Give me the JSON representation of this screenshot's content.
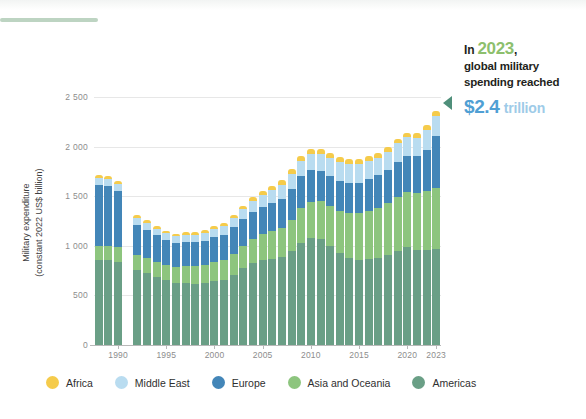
{
  "decor": {
    "accent_rule_color": "#bdd4c2",
    "top_strip_color": "#f2f4f3"
  },
  "annotation": {
    "prefix": "In",
    "year": "2023",
    "comma": ",",
    "line2": "global military",
    "line3": "spending reached",
    "amount": "$2.4",
    "unit": "trillion",
    "year_color": "#8dbf6d",
    "amount_color": "#4f9fd4",
    "unit_color": "#9ecbe8",
    "arrow_icon": "triangle-left-icon",
    "arrow_color": "#4f8f7a"
  },
  "chart_data": {
    "type": "bar",
    "stacked": true,
    "title": "",
    "subtitle": "",
    "xlabel": "",
    "ylabel": "Military expenditure (constant 2022 US$ billion)",
    "ylabel_line1": "Military expenditure",
    "ylabel_line2": "(constant 2022 US$ billion)",
    "ylim": [
      0,
      2500
    ],
    "yticks": [
      0,
      500,
      1000,
      1500,
      2000,
      2500
    ],
    "ytick_labels": [
      "0",
      "500",
      "1 000",
      "1 500",
      "2 000",
      "2 500"
    ],
    "xticks": [
      1990,
      1995,
      2000,
      2005,
      2010,
      2015,
      2020,
      2023
    ],
    "xtick_labels": [
      "1990",
      "1995",
      "2000",
      "2005",
      "2010",
      "2015",
      "2020",
      "2023"
    ],
    "grid": true,
    "legend_position": "bottom",
    "categories": [
      1988,
      1989,
      1990,
      1991,
      1992,
      1993,
      1994,
      1995,
      1996,
      1997,
      1998,
      1999,
      2000,
      2001,
      2002,
      2003,
      2004,
      2005,
      2006,
      2007,
      2008,
      2009,
      2010,
      2011,
      2012,
      2013,
      2014,
      2015,
      2016,
      2017,
      2018,
      2019,
      2020,
      2021,
      2022,
      2023
    ],
    "missing_years": [
      1991
    ],
    "series": [
      {
        "name": "Americas",
        "color": "#6a9f86",
        "values": [
          860,
          855,
          840,
          null,
          760,
          725,
          690,
          655,
          625,
          625,
          620,
          625,
          645,
          655,
          705,
          775,
          830,
          860,
          870,
          885,
          945,
          1030,
          1075,
          1065,
          1000,
          930,
          880,
          860,
          865,
          880,
          905,
          950,
          985,
          955,
          960,
          970
        ]
      },
      {
        "name": "Asia and Oceania",
        "color": "#8dc57e",
        "values": [
          135,
          140,
          145,
          null,
          150,
          150,
          150,
          155,
          160,
          170,
          175,
          180,
          190,
          200,
          215,
          225,
          240,
          255,
          275,
          295,
          320,
          350,
          370,
          385,
          405,
          425,
          450,
          470,
          490,
          505,
          525,
          545,
          560,
          575,
          590,
          615
        ]
      },
      {
        "name": "Europe",
        "color": "#4386b8",
        "values": [
          620,
          610,
          565,
          null,
          300,
          285,
          265,
          250,
          245,
          245,
          240,
          245,
          250,
          255,
          265,
          270,
          275,
          280,
          285,
          295,
          310,
          320,
          315,
          305,
          300,
          300,
          300,
          305,
          315,
          325,
          335,
          350,
          365,
          375,
          420,
          520
        ]
      },
      {
        "name": "Middle East",
        "color": "#b9dcf0",
        "values": [
          65,
          68,
          70,
          null,
          72,
          70,
          68,
          68,
          68,
          72,
          75,
          78,
          85,
          90,
          95,
          100,
          110,
          120,
          130,
          140,
          150,
          160,
          165,
          170,
          180,
          190,
          200,
          195,
          185,
          180,
          185,
          190,
          185,
          185,
          195,
          200
        ]
      },
      {
        "name": "Africa",
        "color": "#f5cb4b",
        "values": [
          30,
          30,
          30,
          null,
          28,
          27,
          26,
          25,
          25,
          25,
          26,
          28,
          30,
          32,
          34,
          36,
          38,
          40,
          42,
          44,
          46,
          48,
          50,
          50,
          50,
          50,
          50,
          48,
          46,
          44,
          44,
          45,
          46,
          48,
          50,
          52
        ]
      }
    ],
    "totals": [
      1710,
      1703,
      1650,
      null,
      1310,
      1257,
      1199,
      1153,
      1123,
      1137,
      1136,
      1156,
      1200,
      1232,
      1314,
      1406,
      1493,
      1555,
      1602,
      1659,
      1771,
      1908,
      1975,
      1975,
      1935,
      1895,
      1880,
      1878,
      1901,
      1934,
      1994,
      2080,
      2141,
      2138,
      2215,
      2357
    ],
    "legend": [
      {
        "label": "Africa",
        "color": "#f5cb4b"
      },
      {
        "label": "Middle East",
        "color": "#b9dcf0"
      },
      {
        "label": "Europe",
        "color": "#4386b8"
      },
      {
        "label": "Asia and Oceania",
        "color": "#8dc57e"
      },
      {
        "label": "Americas",
        "color": "#6a9f86"
      }
    ]
  }
}
